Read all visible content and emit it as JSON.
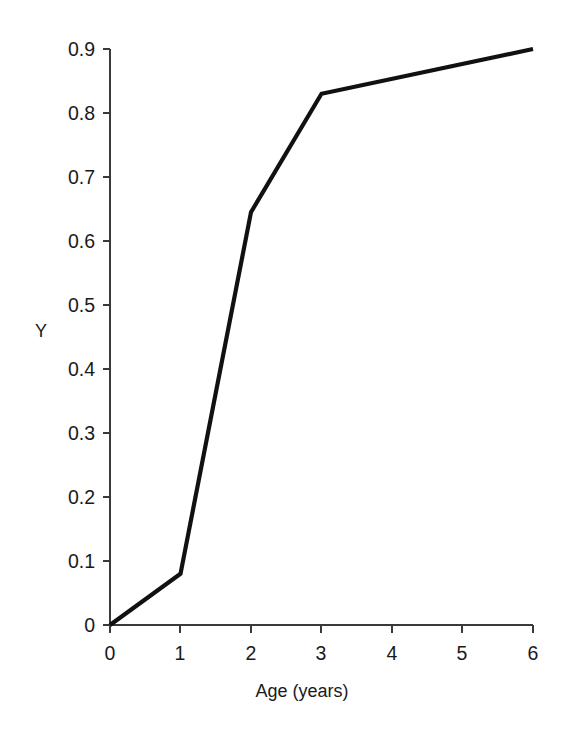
{
  "chart_data": {
    "type": "line",
    "title": "",
    "xlabel": "Age (years)",
    "ylabel": "Y",
    "x": [
      0,
      1,
      2,
      3,
      6
    ],
    "values": [
      0,
      0.08,
      0.645,
      0.83,
      0.9
    ],
    "series": [
      {
        "name": "Y",
        "x": [
          0,
          1,
          2,
          3,
          6
        ],
        "values": [
          0,
          0.08,
          0.645,
          0.83,
          0.9
        ]
      }
    ],
    "xlim": [
      0,
      6
    ],
    "ylim": [
      0,
      0.93
    ],
    "xticks": [
      "0",
      "1",
      "2",
      "3",
      "4",
      "5",
      "6"
    ],
    "xtick_values": [
      0,
      1,
      2,
      3,
      4,
      5,
      6
    ],
    "yticks": [
      "0",
      "0.1",
      "0.2",
      "0.3",
      "0.4",
      "0.5",
      "0.6",
      "0.7",
      "0.8",
      "0.9"
    ],
    "ytick_values": [
      0,
      0.1,
      0.2,
      0.3,
      0.4,
      0.5,
      0.6,
      0.7,
      0.8,
      0.9
    ],
    "grid": false,
    "legend": "none",
    "line_color": "#111111",
    "axis_color": "#3a3a3a",
    "background": "#ffffff"
  },
  "axes": {
    "x_title": "Age (years)",
    "y_title": "Y"
  },
  "xtick_labels": [
    "0",
    "1",
    "2",
    "3",
    "4",
    "5",
    "6"
  ],
  "ytick_labels": [
    "0",
    "0.1",
    "0.2",
    "0.3",
    "0.4",
    "0.5",
    "0.6",
    "0.7",
    "0.8",
    "0.9"
  ]
}
